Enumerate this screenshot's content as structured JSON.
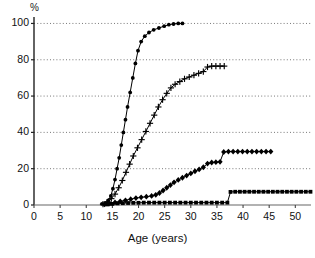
{
  "chart_data": {
    "type": "line",
    "title": "",
    "xlabel": "Age (years)",
    "ylabel": "%",
    "y_unit_label": "%",
    "xlim": [
      0,
      53
    ],
    "ylim": [
      0,
      103
    ],
    "xticks": [
      0,
      5,
      10,
      15,
      20,
      25,
      30,
      35,
      40,
      45,
      50
    ],
    "yticks": [
      0,
      20,
      40,
      60,
      80,
      100
    ],
    "gridlines": {
      "horizontal": [
        20,
        40,
        60,
        80,
        100
      ],
      "style": "dotted",
      "on": true
    },
    "legend": {
      "visible": false,
      "position": "none"
    },
    "series": [
      {
        "name": "series-1",
        "marker": "filled-circle",
        "color": "#000000",
        "points": [
          [
            13.0,
            0.6
          ],
          [
            13.7,
            1.2
          ],
          [
            14.2,
            2.5
          ],
          [
            14.7,
            5.0
          ],
          [
            15.1,
            9.0
          ],
          [
            15.5,
            14.0
          ],
          [
            15.9,
            20.0
          ],
          [
            16.3,
            26.0
          ],
          [
            16.7,
            33.0
          ],
          [
            17.1,
            40.0
          ],
          [
            17.5,
            47.0
          ],
          [
            17.9,
            54.0
          ],
          [
            18.4,
            62.0
          ],
          [
            18.9,
            70.0
          ],
          [
            19.4,
            78.0
          ],
          [
            19.9,
            85.0
          ],
          [
            20.5,
            90.0
          ],
          [
            21.2,
            93.0
          ],
          [
            22.0,
            95.0
          ],
          [
            22.9,
            96.5
          ],
          [
            23.9,
            97.5
          ],
          [
            24.9,
            98.5
          ],
          [
            25.8,
            99.3
          ],
          [
            26.7,
            99.7
          ],
          [
            27.6,
            100.0
          ],
          [
            28.4,
            100.0
          ]
        ]
      },
      {
        "name": "series-2",
        "marker": "plus",
        "color": "#000000",
        "points": [
          [
            13.2,
            0.5
          ],
          [
            14.0,
            1.5
          ],
          [
            14.8,
            3.5
          ],
          [
            15.5,
            6.0
          ],
          [
            16.2,
            9.5
          ],
          [
            16.9,
            13.5
          ],
          [
            17.6,
            18.0
          ],
          [
            18.3,
            22.5
          ],
          [
            19.0,
            27.0
          ],
          [
            19.8,
            31.5
          ],
          [
            20.6,
            36.0
          ],
          [
            21.4,
            40.5
          ],
          [
            22.2,
            45.0
          ],
          [
            23.0,
            49.5
          ],
          [
            23.8,
            54.0
          ],
          [
            24.6,
            58.0
          ],
          [
            25.4,
            61.5
          ],
          [
            26.2,
            64.5
          ],
          [
            27.0,
            66.5
          ],
          [
            27.9,
            68.0
          ],
          [
            28.8,
            69.5
          ],
          [
            29.7,
            70.5
          ],
          [
            30.6,
            71.5
          ],
          [
            31.5,
            72.5
          ],
          [
            32.4,
            73.5
          ],
          [
            33.2,
            76.0
          ],
          [
            34.0,
            76.5
          ],
          [
            34.8,
            76.5
          ],
          [
            35.6,
            76.5
          ],
          [
            36.4,
            76.5
          ]
        ]
      },
      {
        "name": "series-3",
        "marker": "filled-diamond",
        "color": "#000000",
        "points": [
          [
            13.5,
            0.4
          ],
          [
            14.5,
            0.8
          ],
          [
            15.5,
            1.4
          ],
          [
            16.5,
            2.0
          ],
          [
            17.5,
            2.6
          ],
          [
            18.5,
            3.2
          ],
          [
            19.5,
            3.8
          ],
          [
            20.5,
            4.2
          ],
          [
            21.5,
            4.6
          ],
          [
            22.5,
            5.0
          ],
          [
            23.3,
            5.6
          ],
          [
            24.0,
            6.6
          ],
          [
            24.7,
            8.0
          ],
          [
            25.4,
            9.5
          ],
          [
            26.1,
            11.0
          ],
          [
            26.8,
            12.5
          ],
          [
            27.6,
            13.8
          ],
          [
            28.4,
            15.0
          ],
          [
            29.2,
            16.2
          ],
          [
            30.0,
            17.4
          ],
          [
            30.8,
            18.6
          ],
          [
            31.6,
            19.6
          ],
          [
            32.4,
            20.8
          ],
          [
            33.2,
            22.8
          ],
          [
            34.0,
            23.4
          ],
          [
            34.8,
            23.6
          ],
          [
            35.6,
            23.8
          ],
          [
            36.3,
            29.2
          ],
          [
            37.2,
            29.4
          ],
          [
            38.1,
            29.4
          ],
          [
            39.0,
            29.4
          ],
          [
            39.9,
            29.4
          ],
          [
            40.8,
            29.4
          ],
          [
            41.7,
            29.4
          ],
          [
            42.6,
            29.4
          ],
          [
            43.5,
            29.4
          ],
          [
            44.4,
            29.4
          ],
          [
            45.3,
            29.4
          ]
        ]
      },
      {
        "name": "series-4",
        "marker": "filled-square",
        "color": "#000000",
        "points": [
          [
            14.0,
            0.3
          ],
          [
            15.0,
            0.6
          ],
          [
            16.0,
            0.9
          ],
          [
            17.0,
            1.0
          ],
          [
            18.0,
            1.1
          ],
          [
            19.0,
            1.2
          ],
          [
            20.0,
            1.2
          ],
          [
            21.0,
            1.3
          ],
          [
            22.0,
            1.3
          ],
          [
            23.0,
            1.3
          ],
          [
            24.0,
            1.3
          ],
          [
            25.0,
            1.3
          ],
          [
            26.0,
            1.3
          ],
          [
            27.0,
            1.3
          ],
          [
            28.0,
            1.3
          ],
          [
            29.0,
            1.3
          ],
          [
            30.0,
            1.3
          ],
          [
            31.0,
            1.3
          ],
          [
            32.0,
            1.3
          ],
          [
            33.0,
            1.3
          ],
          [
            34.0,
            1.3
          ],
          [
            35.0,
            1.3
          ],
          [
            36.0,
            1.3
          ],
          [
            37.0,
            1.3
          ],
          [
            37.6,
            7.2
          ],
          [
            38.5,
            7.3
          ],
          [
            39.4,
            7.3
          ],
          [
            40.3,
            7.3
          ],
          [
            41.2,
            7.3
          ],
          [
            42.1,
            7.3
          ],
          [
            43.0,
            7.3
          ],
          [
            43.9,
            7.3
          ],
          [
            44.8,
            7.3
          ],
          [
            45.7,
            7.3
          ],
          [
            46.6,
            7.3
          ],
          [
            47.5,
            7.3
          ],
          [
            48.4,
            7.3
          ],
          [
            49.3,
            7.3
          ],
          [
            50.2,
            7.3
          ],
          [
            51.1,
            7.3
          ],
          [
            52.0,
            7.3
          ],
          [
            52.9,
            7.3
          ]
        ]
      }
    ]
  }
}
